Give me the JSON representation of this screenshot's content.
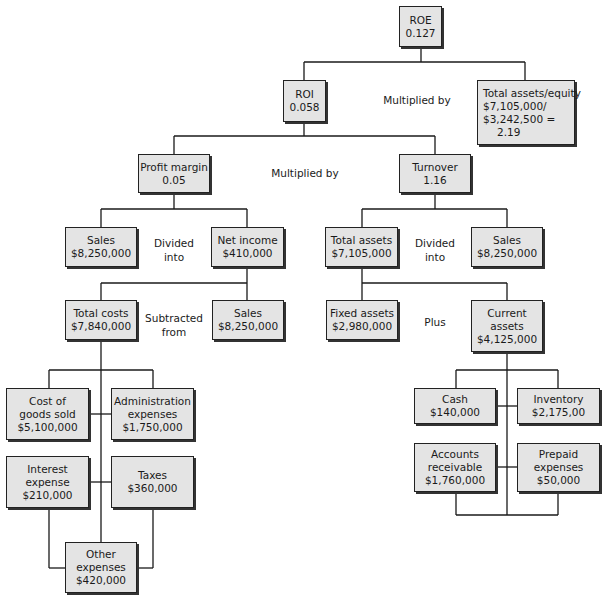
{
  "nodes": {
    "roe": {
      "lines": [
        "ROE",
        "0.127"
      ]
    },
    "roi": {
      "lines": [
        "ROI",
        "0.058"
      ]
    },
    "total_assets_equity": {
      "lines": [
        "Total assets/equity",
        "$7,105,000/",
        "$3,242,500 =",
        "     2.19"
      ]
    },
    "profit_margin": {
      "lines": [
        "Profit margin",
        "0.05"
      ]
    },
    "turnover": {
      "lines": [
        "Turnover",
        "1.16"
      ]
    },
    "sales_pm": {
      "lines": [
        "Sales",
        "$8,250,000"
      ]
    },
    "net_income": {
      "lines": [
        "Net income",
        "$410,000"
      ]
    },
    "total_assets": {
      "lines": [
        "Total assets",
        "$7,105,000"
      ]
    },
    "sales_to": {
      "lines": [
        "Sales",
        "$8,250,000"
      ]
    },
    "total_costs": {
      "lines": [
        "Total costs",
        "$7,840,000"
      ]
    },
    "sales_ni": {
      "lines": [
        "Sales",
        "$8,250,000"
      ]
    },
    "fixed_assets": {
      "lines": [
        "Fixed assets",
        "$2,980,000"
      ]
    },
    "current_assets": {
      "lines": [
        "Current",
        "assets",
        "$4,125,000"
      ]
    },
    "cogs": {
      "lines": [
        "Cost of",
        "goods sold",
        "$5,100,000"
      ]
    },
    "admin": {
      "lines": [
        "Administration",
        "expenses",
        "$1,750,000"
      ]
    },
    "interest": {
      "lines": [
        "Interest",
        "expense",
        "$210,000"
      ]
    },
    "taxes": {
      "lines": [
        "Taxes",
        "$360,000"
      ]
    },
    "other": {
      "lines": [
        "Other",
        "expenses",
        "$420,000"
      ]
    },
    "cash": {
      "lines": [
        "Cash",
        "$140,000"
      ]
    },
    "inventory": {
      "lines": [
        "Inventory",
        "$2,175,00"
      ]
    },
    "receivables": {
      "lines": [
        "Accounts",
        "receivable",
        "$1,760,000"
      ]
    },
    "prepaid": {
      "lines": [
        "Prepaid",
        "expenses",
        "$50,000"
      ]
    }
  },
  "operators": {
    "roe_mult": {
      "lines": [
        "Multiplied by"
      ]
    },
    "roi_mult": {
      "lines": [
        "Multiplied by"
      ]
    },
    "pm_div": {
      "lines": [
        "Divided",
        "into"
      ]
    },
    "to_div": {
      "lines": [
        "Divided",
        "into"
      ]
    },
    "ni_sub": {
      "lines": [
        "Subtracted",
        "from"
      ]
    },
    "ta_plus": {
      "lines": [
        "Plus"
      ]
    }
  }
}
